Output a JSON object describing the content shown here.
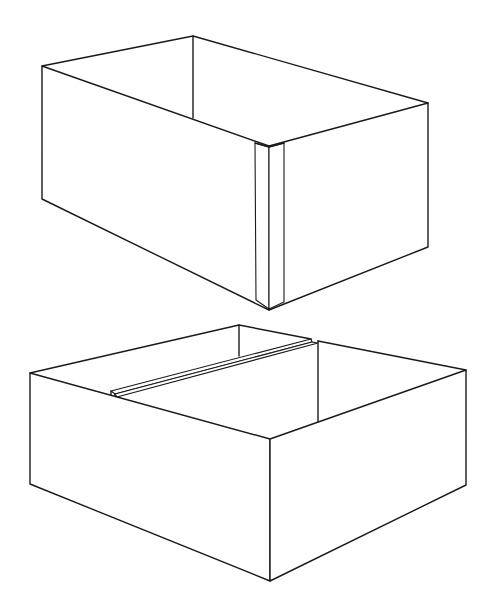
{
  "figure": {
    "background": "#ffffff",
    "line_color": "#1a1a1a",
    "items": [
      {
        "name": "top-box",
        "label": "Open box with taped front corner",
        "feature": "corner-tape-strip"
      },
      {
        "name": "bottom-box",
        "label": "Open box with center divider strip",
        "feature": "divider-strip"
      }
    ]
  }
}
